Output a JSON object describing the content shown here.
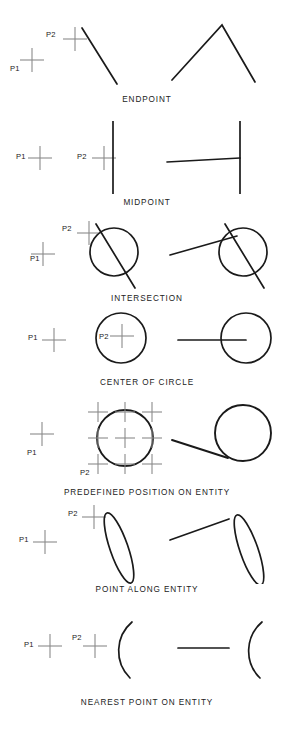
{
  "page": {
    "background_color": "#ffffff",
    "ink_color": "#1a1a1a",
    "crosshair_color": "#8a8a8a",
    "width": 294,
    "height": 729
  },
  "point_labels": {
    "p1": "P1",
    "p2": "P2"
  },
  "rows": [
    {
      "id": "endpoint",
      "caption": "ENDPOINT",
      "p1": "P1",
      "p2": "P2",
      "left_geometry": "line-segment-diagonal",
      "right_geometry": "two-lines-apex"
    },
    {
      "id": "midpoint",
      "caption": "MIDPOINT",
      "p1": "P1",
      "p2": "P2",
      "left_geometry": "vertical-line",
      "right_geometry": "vertical-line-with-horizontal-line-to-midpoint"
    },
    {
      "id": "intersection",
      "caption": "INTERSECTION",
      "p1": "P1",
      "p2": "P2",
      "left_geometry": "circle-with-diagonal-line",
      "right_geometry": "circle-with-diagonal-line-and-long-line"
    },
    {
      "id": "center-of-circle",
      "caption": "CENTER OF CIRCLE",
      "p1": "P1",
      "p2": "P2",
      "left_geometry": "circle",
      "right_geometry": "circle-with-horizontal-line-to-center"
    },
    {
      "id": "predefined-position-on-entity",
      "caption": "PREDEFINED POSITION ON ENTITY",
      "p1": "P1",
      "p2": "P2",
      "left_geometry": "circle-with-nine-crosshairs",
      "right_geometry": "circle-with-tangent-line"
    },
    {
      "id": "point-along-entity",
      "caption": "POINT ALONG ENTITY",
      "p1": "P1",
      "p2": "P2",
      "left_geometry": "narrow-tilted-ellipse",
      "right_geometry": "narrow-tilted-ellipse-with-line"
    },
    {
      "id": "nearest-point-on-entity",
      "caption": "NEAREST POINT ON ENTITY",
      "p1": "P1",
      "p2": "P2",
      "left_geometry": "arc-opening-left",
      "right_geometry": "arc-opening-left-with-horizontal-line"
    }
  ]
}
